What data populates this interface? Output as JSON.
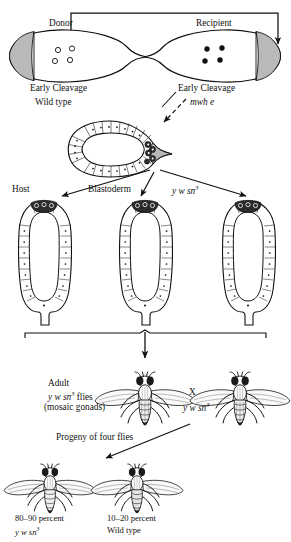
{
  "figure": {
    "domain": "scientific-diagram",
    "ink_color": "#111111",
    "pole_shade_color": "#b9b9b9",
    "background": "#ffffff"
  },
  "stage_top": {
    "donor_label": "Donor",
    "recipient_label": "Recipient",
    "donor_stage": "Early Cleavage",
    "donor_genotype": "Wild type",
    "recipient_stage": "Early Cleavage",
    "recipient_genotype_italic": "mwh e",
    "donor_nuclei_count": 4,
    "donor_nuclei_style": "open",
    "recipient_nuclei_count": 4,
    "recipient_nuclei_style": "filled",
    "transfer_arrow": "pole-cell transplant from donor posterior pole to recipient posterior pole"
  },
  "stage_blastoderm": {
    "section_label": "Blastoderm",
    "host_label": "Host",
    "host_genotype_main": "y w sn",
    "host_genotype_sup": "3",
    "cell_count": 34,
    "pole_cells_note": "dark pole cells at posterior"
  },
  "stage_embryos": {
    "count": 3,
    "bracket": "spans all three host embryos",
    "down_arrow": true
  },
  "stage_adults": {
    "adult_label": "Adult",
    "adult_genotype_main": "y w sn",
    "adult_genotype_sup": "3",
    "adult_genotype_suffix": " flies",
    "adult_note": "(mosaic gonads)",
    "cross_symbol": "X",
    "mate_genotype_main": "y w sn",
    "mate_genotype_sup": "3"
  },
  "stage_progeny": {
    "heading": "Progeny of four flies",
    "results": [
      {
        "percent": "80–90 percent",
        "phenotype_main": "y w sn",
        "phenotype_sup": "3",
        "phenotype_italic": true
      },
      {
        "percent": "10–20 percent",
        "phenotype_main": "Wild type",
        "phenotype_sup": "",
        "phenotype_italic": false
      }
    ]
  }
}
